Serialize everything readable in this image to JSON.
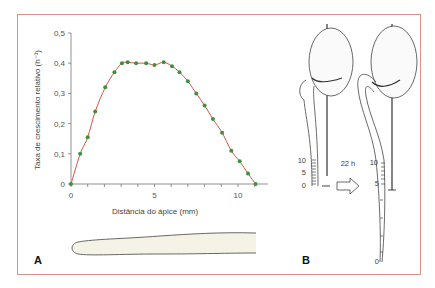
{
  "colors": {
    "frame": "#d9938a",
    "curve": "#d9534a",
    "points": "#3f8f3f",
    "axis": "#777777",
    "root_fill": "#f4f3e6",
    "ink": "#444444"
  },
  "panel_a": {
    "label": "A",
    "ylabel": "Taxa de crescimento relativo (h⁻¹)",
    "xlabel": "Distância do ápice (mm)",
    "y_ticks": [
      "0",
      "0,1",
      "0,2",
      "0,3",
      "0,4",
      "0,5"
    ],
    "x_ticks": [
      "0",
      "5",
      "10"
    ]
  },
  "panel_b": {
    "label": "B",
    "arrow_label": "22 h",
    "left_scale": [
      "10",
      "5",
      "0"
    ],
    "right_scale": [
      "10",
      "5",
      "0"
    ]
  },
  "chart_data": {
    "type": "line",
    "title": "",
    "xlabel": "Distância do ápice (mm)",
    "ylabel": "Taxa de crescimento relativo (h⁻¹)",
    "xlim": [
      0,
      11.5
    ],
    "ylim": [
      0,
      0.5
    ],
    "x_ticks": [
      0,
      5,
      10
    ],
    "x_minor_tick_step": 1,
    "y_ticks": [
      0,
      0.1,
      0.2,
      0.3,
      0.4,
      0.5
    ],
    "grid": false,
    "legend": null,
    "series": [
      {
        "name": "Taxa de crescimento relativo",
        "style": "smooth red line with green markers",
        "x": [
          0,
          0.55,
          1.0,
          1.45,
          2.05,
          2.6,
          3.05,
          3.4,
          3.9,
          4.5,
          5.0,
          5.55,
          6.05,
          6.5,
          7.0,
          7.5,
          8.0,
          8.5,
          9.05,
          9.6,
          10.1,
          10.6,
          11.05
        ],
        "y": [
          0.0,
          0.1,
          0.155,
          0.24,
          0.32,
          0.37,
          0.4,
          0.403,
          0.4,
          0.4,
          0.394,
          0.403,
          0.39,
          0.37,
          0.34,
          0.3,
          0.26,
          0.215,
          0.17,
          0.11,
          0.075,
          0.035,
          0.0
        ]
      }
    ],
    "annotations": [
      "A",
      "B",
      "22 h"
    ]
  }
}
